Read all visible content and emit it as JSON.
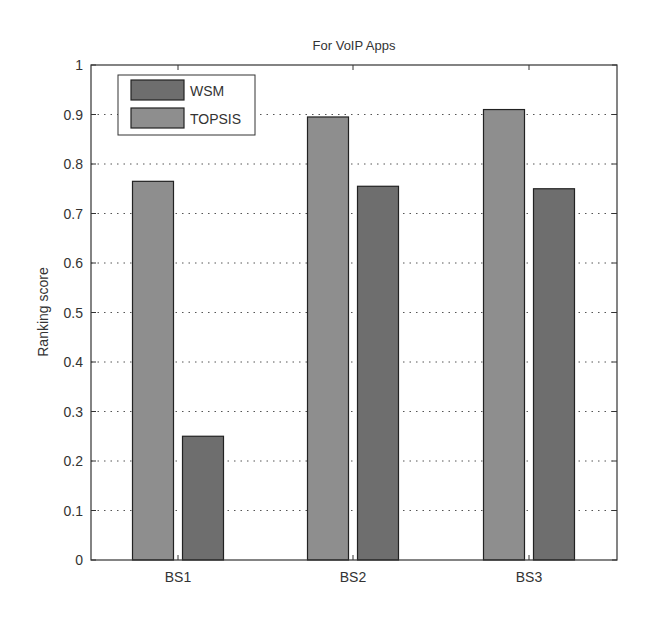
{
  "chart_data": {
    "type": "bar",
    "title": "For VoIP Apps",
    "xlabel": "",
    "ylabel": "Ranking score",
    "categories": [
      "BS1",
      "BS2",
      "BS3"
    ],
    "series": [
      {
        "name": "TOPSIS",
        "color": "#8e8e8e",
        "values": [
          0.765,
          0.895,
          0.91
        ]
      },
      {
        "name": "WSM",
        "color": "#6e6e6e",
        "values": [
          0.25,
          0.755,
          0.75
        ]
      }
    ],
    "legend_order": [
      "WSM",
      "TOPSIS"
    ],
    "legend_position": "upper-left",
    "ylim": [
      0,
      1
    ],
    "yticks": [
      "0",
      "0.1",
      "0.2",
      "0.3",
      "0.4",
      "0.5",
      "0.6",
      "0.7",
      "0.8",
      "0.9",
      "1"
    ],
    "grid": "horizontal-dotted"
  }
}
